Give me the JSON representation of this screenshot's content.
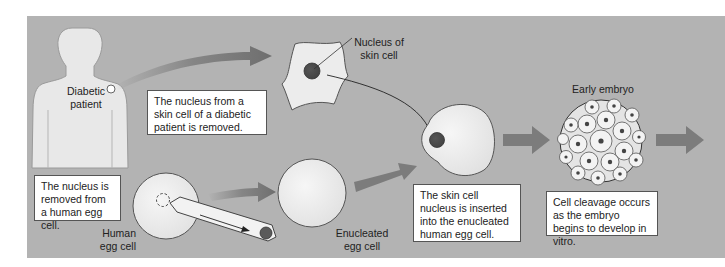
{
  "diagram": {
    "colors": {
      "background_panel": "#b3b3b3",
      "cell_fill": "#ececec",
      "nucleus": "#5a5a5a",
      "arrow": "#7a7a7a"
    },
    "labels": {
      "patient": [
        "Diabetic",
        "patient"
      ],
      "skin_nucleus": [
        "Nucleus of",
        "skin cell"
      ],
      "human_egg": [
        "Human",
        "egg cell"
      ],
      "enucleated_egg": [
        "Enucleated",
        "egg cell"
      ],
      "early_embryo": "Early embryo"
    },
    "steps": [
      {
        "id": "skin-nucleus-removed",
        "text": "The nucleus from a skin cell of a diabetic patient is removed."
      },
      {
        "id": "egg-nucleus-removed",
        "text": "The nucleus is removed from a human egg cell."
      },
      {
        "id": "nucleus-inserted",
        "text": "The skin cell nucleus is inserted into the enucleated human egg cell."
      },
      {
        "id": "cleavage",
        "text": "Cell cleavage occurs as the embryo begins to develop in vitro."
      }
    ]
  }
}
